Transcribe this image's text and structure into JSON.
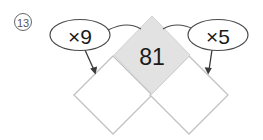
{
  "problem": {
    "number": "13",
    "number_circled": true
  },
  "diagram": {
    "type": "multiplication-diamond-chain",
    "center_cell": {
      "value": "81",
      "filled": true,
      "fill_color": "#e2e2e2"
    },
    "answer_cells": [
      {
        "name": "left-answer-cell",
        "value": "",
        "filled": false,
        "fill_color": "#ffffff"
      },
      {
        "name": "right-answer-cell",
        "value": "",
        "filled": false,
        "fill_color": "#ffffff"
      }
    ],
    "operations": [
      {
        "name": "left-operation",
        "label": "×9",
        "operator": "×",
        "operand": "9"
      },
      {
        "name": "right-operation",
        "label": "×5",
        "operator": "×",
        "operand": "5"
      }
    ],
    "colors": {
      "outline": "#b9b9b9",
      "bubble_outline": "#4a4a4a",
      "arrow": "#3a3a3a",
      "text": "#1a1a1a",
      "background": "#ffffff"
    }
  }
}
